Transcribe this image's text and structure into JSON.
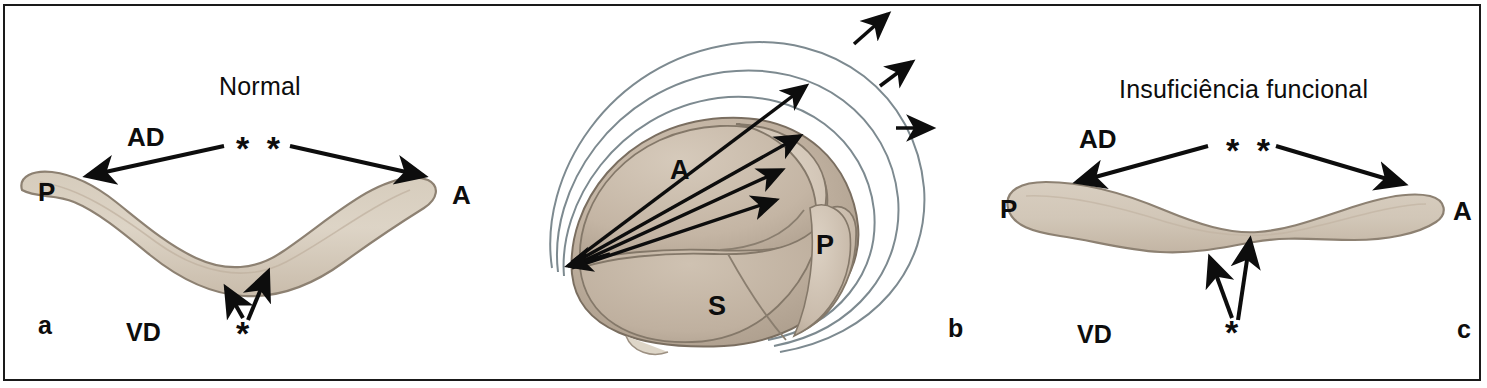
{
  "figure": {
    "kind": "medical-illustration",
    "border_color": "#1a1a1a",
    "background": "#ffffff"
  },
  "palette": {
    "tissue_light": "#d9cfc0",
    "tissue_mid": "#c6b7a6",
    "tissue_dark": "#b3a493",
    "tissue_edge": "#8d8172",
    "arc_stroke": "#7d8a90",
    "ink": "#0d0d0d"
  },
  "panels": [
    {
      "id": "a",
      "letter": "a",
      "title": "Normal",
      "labels": {
        "atrium": "AD",
        "ventricle": "VD",
        "posterior": "P",
        "anterior": "A",
        "coaptation_marker": "* *",
        "leaflet_marker": "*"
      }
    },
    {
      "id": "b",
      "letter": "b",
      "title": "",
      "labels": {
        "anterior_leaflet": "A",
        "posterior_leaflet": "P",
        "septal_leaflet": "S"
      },
      "annulus_rings": 3,
      "radiating_arrows": 4,
      "free_arrows": 3
    },
    {
      "id": "c",
      "letter": "c",
      "title": "Insuficiência funcional",
      "labels": {
        "atrium": "AD",
        "ventricle": "VD",
        "posterior": "P",
        "anterior": "A",
        "coaptation_marker": "* *",
        "leaflet_marker": "*"
      }
    }
  ]
}
